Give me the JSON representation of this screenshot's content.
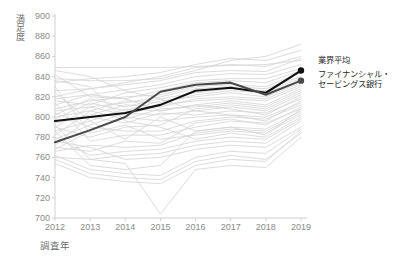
{
  "axes": {
    "y_label": "満足度",
    "x_label": "調査年",
    "y_ticks": [
      "900",
      "880",
      "860",
      "840",
      "820",
      "800",
      "780",
      "760",
      "740",
      "720",
      "700"
    ],
    "x_ticks": [
      "2012",
      "2013",
      "2014",
      "2015",
      "2016",
      "2017",
      "2018",
      "2019"
    ]
  },
  "legend": {
    "industry_average": "業界平均",
    "bank": "ファイナンシャル・\nセービングス銀行"
  },
  "colors": {
    "highlight_dark": "#111111",
    "highlight_mid": "#4a4a4a",
    "background_lines": "#d6d6d6",
    "axis": "#cfcfcf",
    "tick_text": "#8a8a8a"
  },
  "chart_data": {
    "type": "line",
    "title": "",
    "xlabel": "調査年",
    "ylabel": "満足度",
    "x": [
      2012,
      2013,
      2014,
      2015,
      2016,
      2017,
      2018,
      2019
    ],
    "ylim": [
      700,
      900
    ],
    "xlim": [
      2012,
      2019
    ],
    "ytick_step": 20,
    "grid": false,
    "legend_position": "right",
    "series": [
      {
        "name": "業界平均",
        "highlight": true,
        "color": "#111111",
        "marker_end": true,
        "values": [
          796,
          800,
          804,
          812,
          826,
          829,
          824,
          846
        ]
      },
      {
        "name": "ファイナンシャル・セービングス銀行",
        "highlight": true,
        "color": "#4a4a4a",
        "marker_end": true,
        "values": [
          775,
          787,
          800,
          825,
          832,
          834,
          822,
          836
        ]
      },
      {
        "name": "bg-01",
        "highlight": false,
        "values": [
          849,
          849,
          849,
          849,
          850,
          851,
          852,
          856
        ]
      },
      {
        "name": "bg-02",
        "highlight": false,
        "values": [
          838,
          836,
          836,
          838,
          846,
          856,
          860,
          872
        ]
      },
      {
        "name": "bg-03",
        "highlight": false,
        "values": [
          834,
          838,
          840,
          844,
          852,
          858,
          856,
          866
        ]
      },
      {
        "name": "bg-04",
        "highlight": false,
        "values": [
          826,
          828,
          834,
          840,
          849,
          852,
          850,
          860
        ]
      },
      {
        "name": "bg-05",
        "highlight": false,
        "values": [
          820,
          828,
          832,
          836,
          844,
          846,
          845,
          858
        ]
      },
      {
        "name": "bg-06",
        "highlight": false,
        "values": [
          818,
          822,
          827,
          832,
          840,
          843,
          842,
          852
        ]
      },
      {
        "name": "bg-07",
        "highlight": false,
        "values": [
          816,
          812,
          824,
          829,
          836,
          838,
          838,
          848
        ]
      },
      {
        "name": "bg-08",
        "highlight": false,
        "values": [
          812,
          822,
          818,
          826,
          834,
          836,
          834,
          846
        ]
      },
      {
        "name": "bg-09",
        "highlight": false,
        "values": [
          808,
          816,
          820,
          822,
          830,
          832,
          830,
          844
        ]
      },
      {
        "name": "bg-10",
        "highlight": false,
        "values": [
          806,
          810,
          814,
          820,
          828,
          830,
          828,
          840
        ]
      },
      {
        "name": "bg-11",
        "highlight": false,
        "values": [
          802,
          818,
          810,
          818,
          824,
          828,
          826,
          838
        ]
      },
      {
        "name": "bg-12",
        "highlight": false,
        "values": [
          800,
          806,
          816,
          814,
          822,
          826,
          824,
          836
        ]
      },
      {
        "name": "bg-13",
        "highlight": false,
        "values": [
          798,
          814,
          806,
          816,
          820,
          824,
          820,
          834
        ]
      },
      {
        "name": "bg-14",
        "highlight": false,
        "values": [
          794,
          802,
          812,
          810,
          818,
          820,
          818,
          832
        ]
      },
      {
        "name": "bg-15",
        "highlight": false,
        "values": [
          790,
          810,
          802,
          812,
          816,
          818,
          816,
          830
        ]
      },
      {
        "name": "bg-16",
        "highlight": false,
        "values": [
          786,
          796,
          808,
          806,
          812,
          816,
          812,
          828
        ]
      },
      {
        "name": "bg-17",
        "highlight": false,
        "values": [
          782,
          806,
          798,
          808,
          810,
          814,
          810,
          826
        ]
      },
      {
        "name": "bg-18",
        "highlight": false,
        "values": [
          778,
          792,
          804,
          802,
          806,
          810,
          806,
          822
        ]
      },
      {
        "name": "bg-19",
        "highlight": false,
        "values": [
          772,
          800,
          794,
          804,
          802,
          806,
          804,
          818
        ]
      },
      {
        "name": "bg-20",
        "highlight": false,
        "values": [
          768,
          786,
          800,
          796,
          800,
          802,
          800,
          814
        ]
      },
      {
        "name": "bg-21",
        "highlight": false,
        "values": [
          790,
          780,
          790,
          792,
          808,
          812,
          808,
          824
        ]
      },
      {
        "name": "bg-22",
        "highlight": false,
        "values": [
          804,
          790,
          786,
          786,
          796,
          800,
          798,
          812
        ]
      },
      {
        "name": "bg-23",
        "highlight": false,
        "values": [
          814,
          776,
          782,
          782,
          790,
          796,
          794,
          808
        ]
      },
      {
        "name": "bg-24",
        "highlight": false,
        "values": [
          824,
          796,
          778,
          800,
          786,
          790,
          788,
          806
        ]
      },
      {
        "name": "bg-25",
        "highlight": false,
        "values": [
          830,
          784,
          792,
          778,
          782,
          786,
          784,
          802
        ]
      },
      {
        "name": "bg-26",
        "highlight": false,
        "values": [
          836,
          830,
          796,
          790,
          778,
          784,
          780,
          800
        ]
      },
      {
        "name": "bg-27",
        "highlight": false,
        "values": [
          842,
          820,
          818,
          806,
          812,
          808,
          802,
          820
        ]
      },
      {
        "name": "bg-28",
        "highlight": false,
        "values": [
          846,
          840,
          826,
          818,
          806,
          802,
          796,
          816
        ]
      },
      {
        "name": "bg-29",
        "highlight": false,
        "values": [
          770,
          766,
          776,
          774,
          794,
          798,
          792,
          810
        ]
      },
      {
        "name": "bg-30",
        "highlight": false,
        "values": [
          766,
          772,
          770,
          772,
          784,
          788,
          786,
          804
        ]
      },
      {
        "name": "bg-31",
        "highlight": false,
        "values": [
          780,
          762,
          766,
          768,
          776,
          780,
          778,
          798
        ]
      },
      {
        "name": "bg-32",
        "highlight": false,
        "values": [
          760,
          758,
          762,
          764,
          772,
          776,
          774,
          796
        ]
      },
      {
        "name": "bg-33",
        "highlight": false,
        "values": [
          776,
          770,
          758,
          760,
          768,
          772,
          770,
          790
        ]
      },
      {
        "name": "bg-34",
        "highlight": false,
        "values": [
          786,
          752,
          748,
          752,
          786,
          790,
          782,
          808
        ]
      },
      {
        "name": "bg-35",
        "highlight": false,
        "values": [
          762,
          748,
          744,
          742,
          760,
          766,
          764,
          788
        ]
      },
      {
        "name": "bg-36",
        "highlight": false,
        "values": [
          758,
          744,
          740,
          738,
          756,
          762,
          758,
          784
        ]
      },
      {
        "name": "bg-37",
        "highlight": false,
        "values": [
          792,
          758,
          754,
          704,
          748,
          752,
          750,
          780
        ]
      },
      {
        "name": "bg-38",
        "highlight": false,
        "values": [
          754,
          740,
          736,
          734,
          752,
          758,
          756,
          786
        ]
      }
    ]
  }
}
